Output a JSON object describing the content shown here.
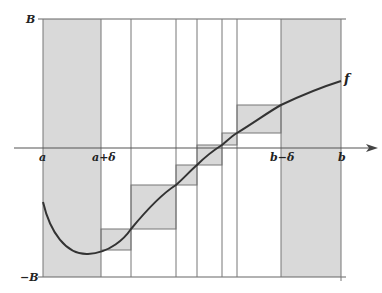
{
  "diagram": {
    "labels": {
      "upper_bound": "B",
      "lower_bound": "−B",
      "a": "a",
      "a_plus_delta": "a+δ",
      "b_minus_delta": "b−δ",
      "b": "b",
      "function": "f"
    },
    "colors": {
      "shade": "#d9d9d9",
      "line": "#777777",
      "curve": "#333333",
      "axis": "#555555"
    },
    "end_strips": [
      {
        "name": "left-strip",
        "from": "a",
        "to": "a+δ"
      },
      {
        "name": "right-strip",
        "from": "b−δ",
        "to": "b"
      }
    ],
    "interior_intervals": 6
  }
}
